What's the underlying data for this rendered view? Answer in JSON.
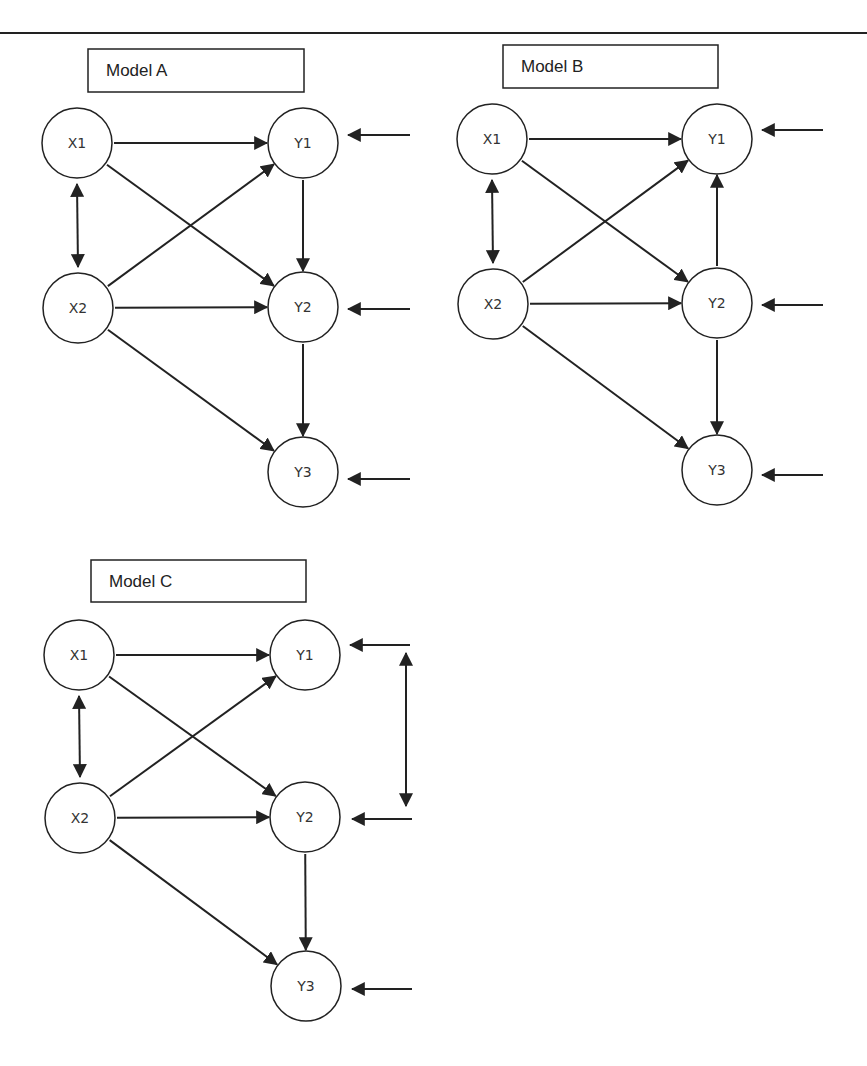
{
  "page": {
    "top_rule": {
      "x1": 0,
      "x2": 867,
      "y": 33
    }
  },
  "models": [
    {
      "id": "A",
      "title": "Model A",
      "title_box": {
        "x": 88,
        "y": 49,
        "w": 216,
        "h": 43
      },
      "nodes": [
        {
          "id": "X1",
          "label": "X1",
          "cx": 77,
          "cy": 143
        },
        {
          "id": "X2",
          "label": "X2",
          "cx": 78,
          "cy": 308
        },
        {
          "id": "Y1",
          "label": "Y1",
          "cx": 303,
          "cy": 143
        },
        {
          "id": "Y2",
          "label": "Y2",
          "cx": 303,
          "cy": 307
        },
        {
          "id": "Y3",
          "label": "Y3",
          "cx": 303,
          "cy": 472
        }
      ],
      "paths": [
        {
          "from": "X1",
          "to": "Y1",
          "type": "directed"
        },
        {
          "from": "X1",
          "to": "Y2",
          "type": "directed"
        },
        {
          "from": "X2",
          "to": "Y1",
          "type": "directed"
        },
        {
          "from": "X2",
          "to": "Y2",
          "type": "directed"
        },
        {
          "from": "X2",
          "to": "Y3",
          "type": "directed"
        },
        {
          "from": "Y1",
          "to": "Y2",
          "type": "directed"
        },
        {
          "from": "Y2",
          "to": "Y3",
          "type": "directed"
        },
        {
          "from": "X1",
          "to": "X2",
          "type": "covariance"
        }
      ],
      "error_terms": [
        {
          "target": "Y1",
          "x1": 410,
          "x2": 348,
          "y": 135
        },
        {
          "target": "Y2",
          "x1": 410,
          "x2": 348,
          "y": 309
        },
        {
          "target": "Y3",
          "x1": 410,
          "x2": 348,
          "y": 479
        }
      ],
      "error_covariances": []
    },
    {
      "id": "B",
      "title": "Model B",
      "title_box": {
        "x": 503,
        "y": 45,
        "w": 215,
        "h": 43
      },
      "nodes": [
        {
          "id": "X1",
          "label": "X1",
          "cx": 492,
          "cy": 139
        },
        {
          "id": "X2",
          "label": "X2",
          "cx": 493,
          "cy": 304
        },
        {
          "id": "Y1",
          "label": "Y1",
          "cx": 717,
          "cy": 139
        },
        {
          "id": "Y2",
          "label": "Y2",
          "cx": 717,
          "cy": 303
        },
        {
          "id": "Y3",
          "label": "Y3",
          "cx": 717,
          "cy": 470
        }
      ],
      "paths": [
        {
          "from": "X1",
          "to": "Y1",
          "type": "directed"
        },
        {
          "from": "X1",
          "to": "Y2",
          "type": "directed"
        },
        {
          "from": "X2",
          "to": "Y1",
          "type": "directed"
        },
        {
          "from": "X2",
          "to": "Y2",
          "type": "directed"
        },
        {
          "from": "X2",
          "to": "Y3",
          "type": "directed"
        },
        {
          "from": "Y2",
          "to": "Y1",
          "type": "directed"
        },
        {
          "from": "Y2",
          "to": "Y3",
          "type": "directed"
        },
        {
          "from": "X1",
          "to": "X2",
          "type": "covariance"
        }
      ],
      "error_terms": [
        {
          "target": "Y1",
          "x1": 823,
          "x2": 762,
          "y": 130
        },
        {
          "target": "Y2",
          "x1": 823,
          "x2": 762,
          "y": 305
        },
        {
          "target": "Y3",
          "x1": 823,
          "x2": 762,
          "y": 475
        }
      ],
      "error_covariances": []
    },
    {
      "id": "C",
      "title": "Model C",
      "title_box": {
        "x": 91,
        "y": 560,
        "w": 215,
        "h": 42
      },
      "nodes": [
        {
          "id": "X1",
          "label": "X1",
          "cx": 79,
          "cy": 655
        },
        {
          "id": "X2",
          "label": "X2",
          "cx": 80,
          "cy": 818
        },
        {
          "id": "Y1",
          "label": "Y1",
          "cx": 305,
          "cy": 655
        },
        {
          "id": "Y2",
          "label": "Y2",
          "cx": 305,
          "cy": 817
        },
        {
          "id": "Y3",
          "label": "Y3",
          "cx": 306,
          "cy": 986
        }
      ],
      "paths": [
        {
          "from": "X1",
          "to": "Y1",
          "type": "directed"
        },
        {
          "from": "X1",
          "to": "Y2",
          "type": "directed"
        },
        {
          "from": "X2",
          "to": "Y1",
          "type": "directed"
        },
        {
          "from": "X2",
          "to": "Y2",
          "type": "directed"
        },
        {
          "from": "X2",
          "to": "Y3",
          "type": "directed"
        },
        {
          "from": "Y2",
          "to": "Y3",
          "type": "directed"
        },
        {
          "from": "X1",
          "to": "X2",
          "type": "covariance"
        }
      ],
      "error_terms": [
        {
          "target": "Y1",
          "x1": 410,
          "x2": 350,
          "y": 645
        },
        {
          "target": "Y2",
          "x1": 412,
          "x2": 352,
          "y": 819
        },
        {
          "target": "Y3",
          "x1": 412,
          "x2": 352,
          "y": 989
        }
      ],
      "error_covariances": [
        {
          "between": [
            "Y1",
            "Y2"
          ],
          "x": 406,
          "y1": 653,
          "y2": 806
        }
      ]
    }
  ],
  "style": {
    "line_color": "#222222",
    "node_radius": 35,
    "background": "#ffffff"
  }
}
